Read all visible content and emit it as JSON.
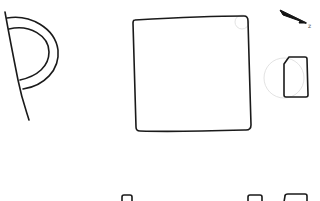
{
  "canvas": {
    "width": 320,
    "height": 201,
    "background": "#ffffff",
    "stroke_color": "#1a1a1a",
    "faint_color": "#e3e3e3"
  },
  "sketch": {
    "north_arrow": {
      "label": "z"
    },
    "shapes": [
      {
        "name": "wall-line-with-door-swing",
        "description": "diagonal wall line with double semicircular arc"
      },
      {
        "name": "square-room",
        "description": "large hand-drawn square with faint corner circle"
      },
      {
        "name": "north-arrow",
        "description": "arrow pointing down-right with small label"
      },
      {
        "name": "small-rounded-rect",
        "description": "small rectangle with clipped corner and faint circle behind"
      },
      {
        "name": "bottom-partial-shapes",
        "description": "three shapes cut off at bottom edge"
      }
    ]
  }
}
